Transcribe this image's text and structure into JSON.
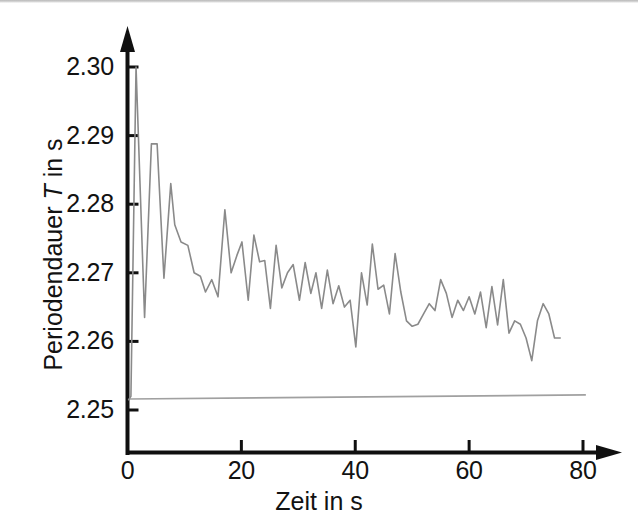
{
  "figure": {
    "background_color": "#ffffff",
    "axis_color": "#101010",
    "series_color": "#8a8a8a",
    "reference_line_color": "#a0a0a0",
    "width": 638,
    "height": 527
  },
  "axes": {
    "x_title": "Zeit in s",
    "y_title_prefix": "Periodendauer ",
    "y_title_symbol": "T",
    "y_title_suffix": " in s",
    "x_ticks": [
      "0",
      "20",
      "40",
      "60",
      "80"
    ],
    "y_ticks": [
      "2.30",
      "2.29",
      "2.28",
      "2.27",
      "2.26",
      "2.25"
    ]
  },
  "chart_data": {
    "type": "line",
    "title": "",
    "xlabel": "Zeit in s",
    "ylabel": "Periodendauer T in s",
    "xlim": [
      0,
      84
    ],
    "ylim": [
      2.2485,
      2.3025
    ],
    "grid": false,
    "legend": null,
    "x_tick_values": [
      0,
      20,
      40,
      60,
      80
    ],
    "y_tick_values": [
      2.25,
      2.26,
      2.27,
      2.28,
      2.29,
      2.3
    ],
    "series": [
      {
        "name": "Periodendauer T",
        "color": "#8a8a8a",
        "x": [
          0.2,
          0.6,
          1.5,
          3.0,
          4.2,
          5.2,
          6.4,
          7.6,
          8.3,
          9.4,
          10.6,
          11.7,
          12.8,
          13.7,
          14.8,
          15.9,
          17.1,
          18.2,
          19.2,
          20.1,
          21.2,
          22.2,
          23.2,
          24.1,
          25.1,
          26.1,
          27.1,
          28.1,
          29.1,
          30.2,
          31.2,
          32.2,
          33.1,
          34.1,
          35.1,
          36.1,
          37.1,
          38.1,
          39.1,
          40.1,
          41.1,
          42.1,
          43.0,
          44.0,
          45.0,
          46.0,
          47.0,
          48.0,
          49.0,
          50.0,
          51.0,
          52.0,
          53.0,
          54.0,
          55.0,
          56.0,
          57.0,
          58.0,
          59.0,
          60.0,
          61.0,
          62.0,
          63.0,
          64.0,
          65.0,
          66.0,
          67.0,
          68.0,
          69.0,
          70.0,
          71.0,
          72.0,
          73.0,
          74.0,
          75.0,
          76.0
        ],
        "y": [
          2.2515,
          2.252,
          2.3,
          2.2635,
          2.2888,
          2.2888,
          2.2692,
          2.283,
          2.277,
          2.2745,
          2.274,
          2.27,
          2.2695,
          2.2672,
          2.269,
          2.2665,
          2.2792,
          2.27,
          2.2725,
          2.2745,
          2.266,
          2.2755,
          2.2716,
          2.2718,
          2.2648,
          2.274,
          2.2678,
          2.27,
          2.2712,
          2.266,
          2.2715,
          2.267,
          2.27,
          2.2648,
          2.2704,
          2.2655,
          2.2681,
          2.265,
          2.266,
          2.2592,
          2.27,
          2.2653,
          2.2742,
          2.2676,
          2.2682,
          2.264,
          2.2728,
          2.2672,
          2.263,
          2.2622,
          2.2625,
          2.264,
          2.2655,
          2.2645,
          2.269,
          2.267,
          2.2635,
          2.266,
          2.2645,
          2.2665,
          2.264,
          2.2672,
          2.262,
          2.268,
          2.2624,
          2.269,
          2.2612,
          2.263,
          2.2625,
          2.2605,
          2.2572,
          2.263,
          2.2655,
          2.264,
          2.2605,
          2.2605
        ]
      }
    ],
    "reference_line": {
      "name": "Sollwert-Linie",
      "color": "#a0a0a0",
      "x": [
        0.3,
        80.5
      ],
      "y": [
        2.2516,
        2.2522
      ]
    }
  }
}
